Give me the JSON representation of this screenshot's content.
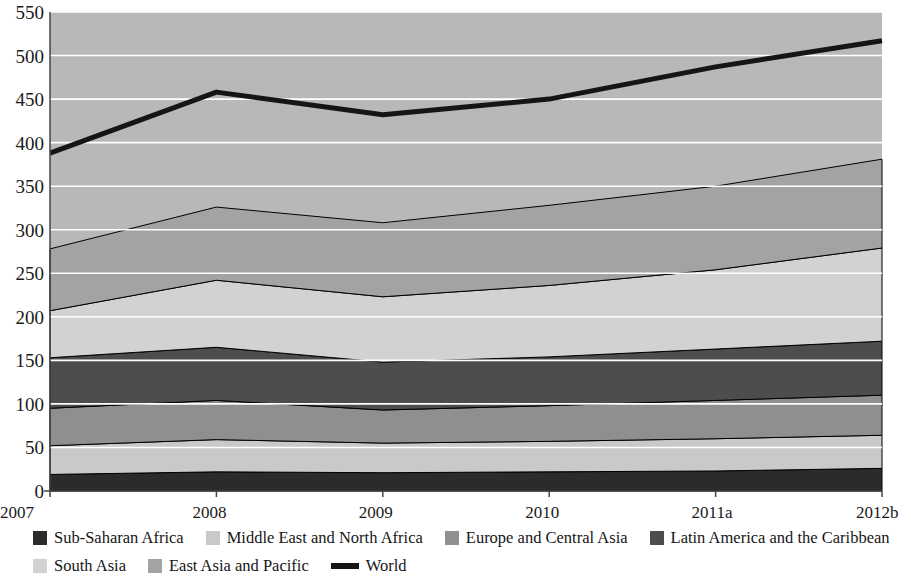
{
  "chart_data": {
    "type": "area",
    "title": "",
    "xlabel": "",
    "ylabel": "",
    "stacked": true,
    "grid": true,
    "gridlines_color": "#ffffff",
    "plot_background": "#b8b8b8",
    "ylim": [
      0,
      550
    ],
    "ytick_step": 50,
    "y_ticks": [
      "0",
      "50",
      "100",
      "150",
      "200",
      "250",
      "300",
      "350",
      "400",
      "450",
      "500",
      "550"
    ],
    "categories": [
      "2007",
      "2008",
      "2009",
      "2010",
      "2011a",
      "2012b"
    ],
    "legend_position": "bottom",
    "series": [
      {
        "name": "Sub-Saharan Africa",
        "color": "#2b2b2b",
        "values": [
          19,
          22,
          21,
          22,
          23,
          26
        ]
      },
      {
        "name": "Middle East and North Africa",
        "color": "#c9c9c9",
        "values": [
          33,
          37,
          34,
          35,
          37,
          38
        ]
      },
      {
        "name": "Europe and Central Asia",
        "color": "#8f8f8f",
        "values": [
          43,
          45,
          38,
          41,
          44,
          46
        ]
      },
      {
        "name": "Latin America and the Caribbean",
        "color": "#4d4d4d",
        "values": [
          58,
          61,
          55,
          56,
          59,
          62
        ]
      },
      {
        "name": "South Asia",
        "color": "#d2d2d2",
        "values": [
          54,
          77,
          75,
          82,
          91,
          107
        ]
      },
      {
        "name": "East Asia and Pacific",
        "color": "#a3a3a3",
        "values": [
          71,
          84,
          85,
          92,
          96,
          102
        ]
      }
    ],
    "line_series": {
      "name": "World",
      "color": "#151515",
      "values": [
        388,
        458,
        432,
        450,
        487,
        517
      ]
    }
  },
  "axis": {
    "x_ticks": [
      "2007",
      "2008",
      "2009",
      "2010",
      "2011a",
      "2012b"
    ],
    "y_ticks": [
      "550",
      "500",
      "450",
      "400",
      "350",
      "300",
      "250",
      "200",
      "150",
      "100",
      "50",
      "0"
    ]
  },
  "legend": {
    "row1": [
      {
        "label": "Sub-Saharan Africa",
        "swatch": "#2b2b2b",
        "kind": "swatch"
      },
      {
        "label": "Middle East and North Africa",
        "swatch": "#c9c9c9",
        "kind": "swatch"
      },
      {
        "label": "Europe and Central Asia",
        "swatch": "#8f8f8f",
        "kind": "swatch"
      },
      {
        "label": "Latin America and the Caribbean",
        "swatch": "#4d4d4d",
        "kind": "swatch"
      }
    ],
    "row2": [
      {
        "label": "South Asia",
        "swatch": "#d2d2d2",
        "kind": "swatch"
      },
      {
        "label": "East Asia and Pacific",
        "swatch": "#a3a3a3",
        "kind": "swatch"
      },
      {
        "label": "World",
        "swatch": "#151515",
        "kind": "line"
      }
    ]
  }
}
